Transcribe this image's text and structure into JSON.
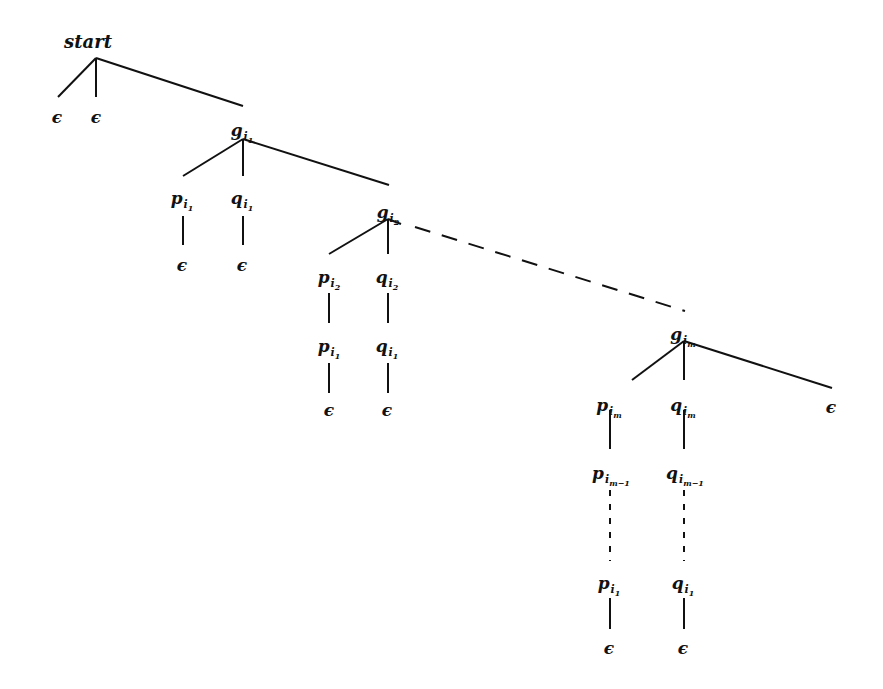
{
  "diagram": {
    "type": "tree",
    "colors": {
      "ink": "#111111",
      "background": "#ffffff"
    },
    "nodes": [
      {
        "id": "start",
        "base": "start",
        "sub": "",
        "subsub": "",
        "x": 88,
        "y": 42
      },
      {
        "id": "eps_s1",
        "base": "ϵ",
        "sub": "",
        "subsub": "",
        "x": 57,
        "y": 117
      },
      {
        "id": "eps_s2",
        "base": "ϵ",
        "sub": "",
        "subsub": "",
        "x": 96,
        "y": 117
      },
      {
        "id": "g1",
        "base": "g",
        "sub": "i",
        "subsub": "1",
        "x": 242,
        "y": 130
      },
      {
        "id": "p1a",
        "base": "p",
        "sub": "i",
        "subsub": "1",
        "x": 182,
        "y": 198
      },
      {
        "id": "q1a",
        "base": "q",
        "sub": "i",
        "subsub": "1",
        "x": 242,
        "y": 198
      },
      {
        "id": "eps_p1a",
        "base": "ϵ",
        "sub": "",
        "subsub": "",
        "x": 182,
        "y": 265
      },
      {
        "id": "eps_q1a",
        "base": "ϵ",
        "sub": "",
        "subsub": "",
        "x": 242,
        "y": 265
      },
      {
        "id": "g2",
        "base": "g",
        "sub": "i",
        "subsub": "2",
        "x": 388,
        "y": 212
      },
      {
        "id": "p2",
        "base": "p",
        "sub": "i",
        "subsub": "2",
        "x": 329,
        "y": 277
      },
      {
        "id": "q2",
        "base": "q",
        "sub": "i",
        "subsub": "2",
        "x": 387,
        "y": 277
      },
      {
        "id": "p1b",
        "base": "p",
        "sub": "i",
        "subsub": "1",
        "x": 329,
        "y": 346
      },
      {
        "id": "q1b",
        "base": "q",
        "sub": "i",
        "subsub": "1",
        "x": 387,
        "y": 346
      },
      {
        "id": "eps_p1b",
        "base": "ϵ",
        "sub": "",
        "subsub": "",
        "x": 329,
        "y": 410
      },
      {
        "id": "eps_q1b",
        "base": "ϵ",
        "sub": "",
        "subsub": "",
        "x": 387,
        "y": 410
      },
      {
        "id": "gm",
        "base": "g",
        "sub": "i",
        "subsub": "m",
        "x": 683,
        "y": 334
      },
      {
        "id": "pm",
        "base": "p",
        "sub": "i",
        "subsub": "m",
        "x": 609,
        "y": 405
      },
      {
        "id": "qm",
        "base": "q",
        "sub": "i",
        "subsub": "m",
        "x": 683,
        "y": 405
      },
      {
        "id": "eps_gm",
        "base": "ϵ",
        "sub": "",
        "subsub": "",
        "x": 831,
        "y": 407
      },
      {
        "id": "pm1",
        "base": "p",
        "sub": "i",
        "subsub": "m−1",
        "x": 611,
        "y": 473
      },
      {
        "id": "qm1",
        "base": "q",
        "sub": "i",
        "subsub": "m−1",
        "x": 685,
        "y": 473
      },
      {
        "id": "p1c",
        "base": "p",
        "sub": "i",
        "subsub": "1",
        "x": 609,
        "y": 583
      },
      {
        "id": "q1c",
        "base": "q",
        "sub": "i",
        "subsub": "1",
        "x": 683,
        "y": 583
      },
      {
        "id": "eps_p1c",
        "base": "ϵ",
        "sub": "",
        "subsub": "",
        "x": 609,
        "y": 648
      },
      {
        "id": "eps_q1c",
        "base": "ϵ",
        "sub": "",
        "subsub": "",
        "x": 683,
        "y": 648
      }
    ],
    "edges": [
      {
        "x1": 96,
        "y1": 58,
        "x2": 58,
        "y2": 97,
        "style": "solid"
      },
      {
        "x1": 96,
        "y1": 58,
        "x2": 96,
        "y2": 97,
        "style": "solid"
      },
      {
        "x1": 96,
        "y1": 58,
        "x2": 243,
        "y2": 106,
        "style": "solid"
      },
      {
        "x1": 243,
        "y1": 139,
        "x2": 183,
        "y2": 176,
        "style": "solid"
      },
      {
        "x1": 243,
        "y1": 139,
        "x2": 243,
        "y2": 176,
        "style": "solid"
      },
      {
        "x1": 243,
        "y1": 139,
        "x2": 389,
        "y2": 185,
        "style": "solid"
      },
      {
        "x1": 183,
        "y1": 216,
        "x2": 183,
        "y2": 245,
        "style": "solid"
      },
      {
        "x1": 243,
        "y1": 216,
        "x2": 243,
        "y2": 245,
        "style": "solid"
      },
      {
        "x1": 388,
        "y1": 219,
        "x2": 329,
        "y2": 254,
        "style": "solid"
      },
      {
        "x1": 388,
        "y1": 219,
        "x2": 388,
        "y2": 254,
        "style": "solid"
      },
      {
        "x1": 388,
        "y1": 219,
        "x2": 401,
        "y2": 224,
        "style": "solid"
      },
      {
        "x1": 415,
        "y1": 227,
        "x2": 685,
        "y2": 311,
        "style": "dashed"
      },
      {
        "x1": 329,
        "y1": 293,
        "x2": 329,
        "y2": 323,
        "style": "solid"
      },
      {
        "x1": 388,
        "y1": 293,
        "x2": 388,
        "y2": 323,
        "style": "solid"
      },
      {
        "x1": 329,
        "y1": 363,
        "x2": 329,
        "y2": 393,
        "style": "solid"
      },
      {
        "x1": 388,
        "y1": 363,
        "x2": 388,
        "y2": 393,
        "style": "solid"
      },
      {
        "x1": 684,
        "y1": 341,
        "x2": 632,
        "y2": 380,
        "style": "solid"
      },
      {
        "x1": 684,
        "y1": 341,
        "x2": 684,
        "y2": 380,
        "style": "solid"
      },
      {
        "x1": 684,
        "y1": 341,
        "x2": 832,
        "y2": 388,
        "style": "solid"
      },
      {
        "x1": 610,
        "y1": 410,
        "x2": 610,
        "y2": 449,
        "style": "solid"
      },
      {
        "x1": 684,
        "y1": 410,
        "x2": 684,
        "y2": 449,
        "style": "solid"
      },
      {
        "x1": 610,
        "y1": 490,
        "x2": 610,
        "y2": 561,
        "style": "dotted"
      },
      {
        "x1": 684,
        "y1": 490,
        "x2": 684,
        "y2": 561,
        "style": "dotted"
      },
      {
        "x1": 610,
        "y1": 598,
        "x2": 610,
        "y2": 629,
        "style": "solid"
      },
      {
        "x1": 684,
        "y1": 598,
        "x2": 684,
        "y2": 629,
        "style": "solid"
      }
    ]
  }
}
